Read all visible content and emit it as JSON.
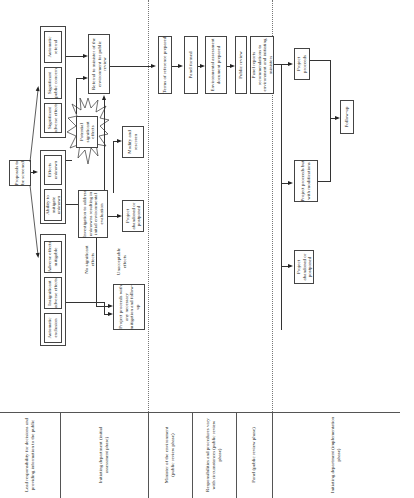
{
  "diagram": {
    "orientation": "rotated 90deg counter-clockwise",
    "start": {
      "label": "Proposals to be screened"
    },
    "screening_groups": [
      {
        "id": "no-review",
        "items": [
          "Automatic exclusion",
          "Insignificant adverse effects",
          "Adverse effects mitigable"
        ]
      },
      {
        "id": "uncertain",
        "items": [
          "Ability to mitigate unknown",
          "Effects unknown"
        ]
      },
      {
        "id": "referral",
        "items": [
          "Significant adverse effects",
          "Significant public concern",
          "Automatic referral"
        ]
      }
    ],
    "nodes": {
      "potential_effects": "Potential significant effects",
      "investigation": "Investigation to address unknowns resulting in initial environmental evaluation",
      "modify": "Modify and rescreen",
      "abandon_initial": "Project abandoned or postponed",
      "proceeds_mitigation": "Project proceeds with any necessary mitigation and follow-up",
      "referral_minister": "Referral to minister of the environment for public review",
      "terms_reference": "Terms of reference prepared",
      "panel_formed": "Panel formed",
      "ea_document": "Environmental assessment document prepared",
      "public_review": "Public review",
      "panel_reports": "Panel reports recommendations to environment and initiating ministers",
      "project_proceeds": "Project proceeds",
      "proceeds_modifications": "Project proceeds but with modifications",
      "follow_up": "Follow-up",
      "abandon_final": "Project abandoned or postponed"
    },
    "edge_labels": {
      "no_significant": "No significant effects",
      "unacceptable": "Unacceptable effects"
    },
    "lanes": {
      "header": "Lead responsibility for decisions and providing information to the public",
      "items": [
        "Initiating department (initial assessment phase)",
        "Minister of the environment (public review phase)",
        "Responsibilities and procedures vary with circumstances (public review phase)",
        "Panel (public review phase)",
        "Initiating department (implementation phase)"
      ]
    }
  }
}
